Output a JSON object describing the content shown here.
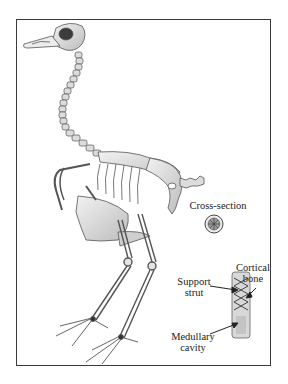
{
  "figure": {
    "labels": {
      "cross_section": "Cross-section",
      "cortical_bone_line1": "Cortical",
      "cortical_bone_line2": "bone",
      "support_strut_line1": "Support",
      "support_strut_line2": "strut",
      "medullary_cavity_line1": "Medullary",
      "medullary_cavity_line2": "cavity"
    },
    "colors": {
      "frame": "#3a3a3a",
      "bone_fill": "#e4e4e4",
      "bone_stroke": "#5a5a5a",
      "shadow": "#8a8a8a",
      "text": "#222222"
    }
  }
}
